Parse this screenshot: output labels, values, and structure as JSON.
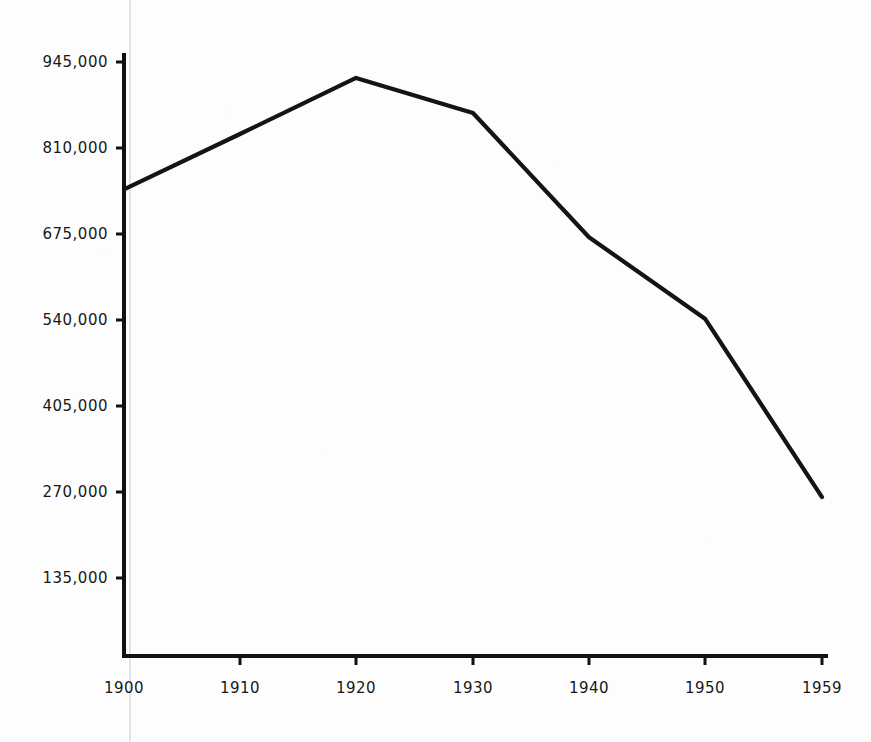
{
  "chart_data": {
    "type": "line",
    "title": "",
    "subtitle": "",
    "xlabel": "",
    "ylabel": "",
    "grid": false,
    "legend": false,
    "legend_position": "none",
    "line_color": "#141414",
    "axis_color": "#111111",
    "background_color": "#fdfdfd",
    "x": [
      1900,
      1910,
      1920,
      1930,
      1940,
      1950,
      1959
    ],
    "categories": [
      "1900",
      "1910",
      "1920",
      "1930",
      "1940",
      "1950",
      "1959"
    ],
    "xtick_labels": [
      "1900",
      "1910",
      "1920",
      "1930",
      "1940",
      "1950",
      "1959"
    ],
    "ytick_labels": [
      "945,000",
      "810,000",
      "675,000",
      "540,000",
      "405,000",
      "270,000",
      "135,000"
    ],
    "ytick_values": [
      945000,
      810000,
      675000,
      540000,
      405000,
      270000,
      135000
    ],
    "xlim": [
      1900,
      1959
    ],
    "ylim": [
      0,
      1012500
    ],
    "values": [
      745000,
      832000,
      920000,
      865000,
      670000,
      542000,
      262000
    ],
    "series": [
      {
        "name": "",
        "values": [
          745000,
          832000,
          920000,
          865000,
          670000,
          542000,
          262000
        ]
      }
    ],
    "points": [
      {
        "x": "1900",
        "y": 745000
      },
      {
        "x": "1910",
        "y": 832000
      },
      {
        "x": "1920",
        "y": 920000
      },
      {
        "x": "1930",
        "y": 865000
      },
      {
        "x": "1940",
        "y": 670000
      },
      {
        "x": "1950",
        "y": 542000
      },
      {
        "x": "1959",
        "y": 262000
      }
    ],
    "annotations": []
  },
  "axes": {
    "y_labels": [
      {
        "text": "945,000",
        "py": 62
      },
      {
        "text": "810,000",
        "py": 148
      },
      {
        "text": "675,000",
        "py": 234
      },
      {
        "text": "540,000",
        "py": 320
      },
      {
        "text": "405,000",
        "py": 406
      },
      {
        "text": "270,000",
        "py": 492
      },
      {
        "text": "135,000",
        "py": 578
      }
    ],
    "x_labels": [
      {
        "text": "1900",
        "px": 124
      },
      {
        "text": "1910",
        "px": 240
      },
      {
        "text": "1920",
        "px": 356
      },
      {
        "text": "1930",
        "px": 473
      },
      {
        "text": "1940",
        "px": 589
      },
      {
        "text": "1950",
        "px": 705
      },
      {
        "text": "1959",
        "px": 822
      }
    ]
  }
}
